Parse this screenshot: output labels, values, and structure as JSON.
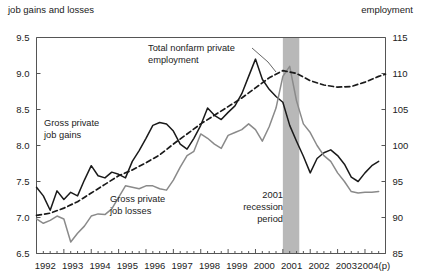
{
  "header": {
    "left_title": "job gains and losses",
    "right_title": "employment"
  },
  "annotations": {
    "nonfarm_line1": "Total nonfarm private",
    "nonfarm_line2": "employment",
    "gains_line1": "Gross private",
    "gains_line2": "job gains",
    "losses_line1": "Gross private",
    "losses_line2": "job losses",
    "recession_line1": "2001",
    "recession_line2": "recession",
    "recession_line3": "period"
  },
  "colors": {
    "gains": "#1a1a1a",
    "losses": "#8a8a8a",
    "employment": "#1a1a1a",
    "recession_band": "#b8b8b8",
    "axis": "#555555"
  },
  "chart_data": {
    "type": "line",
    "title": "",
    "xlabel": "",
    "ylabel": "job gains and losses",
    "y2label": "employment",
    "grid": false,
    "legend": "annotations",
    "ylim": [
      6.5,
      9.5
    ],
    "ytick_labels": [
      "9.5",
      "9.0",
      "8.5",
      "8.0",
      "7.5",
      "7.0",
      "6.5"
    ],
    "yticks": [
      9.5,
      9.0,
      8.5,
      8.0,
      7.5,
      7.0,
      6.5
    ],
    "y2lim": [
      85,
      115
    ],
    "y2ticks": [
      115,
      110,
      105,
      100,
      95,
      90,
      85
    ],
    "y2tick_labels": [
      "115",
      "110",
      "105",
      "100",
      "95",
      "90",
      "85"
    ],
    "xtick_labels": [
      "1992",
      "1993",
      "1994",
      "1995",
      "1996",
      "1997",
      "1998",
      "1999",
      "2000",
      "2001",
      "2002",
      "2003",
      "2004(p)"
    ],
    "x_start_year": 1992,
    "x_end_year": 2004.75,
    "recession_band": {
      "start": 2001.0,
      "end": 2001.6,
      "label": "2001 recession period"
    },
    "series": [
      {
        "name": "Gross private job gains",
        "axis": "left",
        "style": "solid",
        "color": "#1a1a1a",
        "x": [
          1992.0,
          1992.25,
          1992.5,
          1992.75,
          1993.0,
          1993.25,
          1993.5,
          1993.75,
          1994.0,
          1994.25,
          1994.5,
          1994.75,
          1995.0,
          1995.25,
          1995.5,
          1995.75,
          1996.0,
          1996.25,
          1996.5,
          1996.75,
          1997.0,
          1997.25,
          1997.5,
          1997.75,
          1998.0,
          1998.25,
          1998.5,
          1998.75,
          1999.0,
          1999.25,
          1999.5,
          1999.75,
          2000.0,
          2000.25,
          2000.5,
          2000.75,
          2001.0,
          2001.25,
          2001.5,
          2001.75,
          2002.0,
          2002.25,
          2002.5,
          2002.75,
          2003.0,
          2003.25,
          2003.5,
          2003.75,
          2004.0,
          2004.25,
          2004.5
        ],
        "values": [
          7.42,
          7.3,
          7.1,
          7.37,
          7.25,
          7.35,
          7.3,
          7.52,
          7.72,
          7.58,
          7.55,
          7.63,
          7.6,
          7.55,
          7.78,
          7.93,
          8.1,
          8.28,
          8.32,
          8.3,
          8.2,
          8.02,
          7.95,
          8.1,
          8.28,
          8.52,
          8.42,
          8.36,
          8.46,
          8.55,
          8.72,
          8.96,
          9.2,
          8.92,
          8.78,
          8.68,
          8.6,
          8.28,
          8.06,
          7.85,
          7.62,
          7.82,
          7.9,
          7.94,
          7.86,
          7.74,
          7.56,
          7.5,
          7.62,
          7.72,
          7.78
        ]
      },
      {
        "name": "Gross private job losses",
        "axis": "left",
        "style": "solid",
        "color": "#8a8a8a",
        "x": [
          1992.0,
          1992.25,
          1992.5,
          1992.75,
          1993.0,
          1993.25,
          1993.5,
          1993.75,
          1994.0,
          1994.25,
          1994.5,
          1994.75,
          1995.0,
          1995.25,
          1995.5,
          1995.75,
          1996.0,
          1996.25,
          1996.5,
          1996.75,
          1997.0,
          1997.25,
          1997.5,
          1997.75,
          1998.0,
          1998.25,
          1998.5,
          1998.75,
          1999.0,
          1999.25,
          1999.5,
          1999.75,
          2000.0,
          2000.25,
          2000.5,
          2000.75,
          2001.0,
          2001.25,
          2001.5,
          2001.75,
          2002.0,
          2002.25,
          2002.5,
          2002.75,
          2003.0,
          2003.25,
          2003.5,
          2003.75,
          2004.0,
          2004.25,
          2004.5
        ],
        "values": [
          6.98,
          6.92,
          6.96,
          7.02,
          6.98,
          6.66,
          6.78,
          6.88,
          7.02,
          7.05,
          7.04,
          7.12,
          7.28,
          7.44,
          7.42,
          7.4,
          7.44,
          7.44,
          7.4,
          7.38,
          7.52,
          7.7,
          7.86,
          7.92,
          8.16,
          8.1,
          8.02,
          7.96,
          8.14,
          8.18,
          8.22,
          8.3,
          8.22,
          8.06,
          8.26,
          8.52,
          8.96,
          9.1,
          8.62,
          8.3,
          8.18,
          8.0,
          7.86,
          7.78,
          7.62,
          7.5,
          7.36,
          7.34,
          7.35,
          7.35,
          7.36
        ]
      },
      {
        "name": "Total nonfarm private employment",
        "axis": "right",
        "style": "dashed",
        "color": "#1a1a1a",
        "x": [
          1992.0,
          1992.5,
          1993.0,
          1993.5,
          1994.0,
          1994.5,
          1995.0,
          1995.5,
          1996.0,
          1996.5,
          1997.0,
          1997.5,
          1998.0,
          1998.5,
          1999.0,
          1999.5,
          2000.0,
          2000.5,
          2001.0,
          2001.5,
          2002.0,
          2002.5,
          2003.0,
          2003.5,
          2004.0,
          2004.5,
          2004.75
        ],
        "values": [
          90.3,
          90.6,
          91.3,
          92.2,
          93.4,
          94.6,
          95.8,
          96.6,
          97.6,
          98.7,
          100.2,
          101.6,
          103.0,
          104.2,
          105.4,
          106.6,
          108.0,
          109.4,
          110.4,
          110.0,
          109.0,
          108.4,
          108.1,
          108.2,
          108.8,
          109.6,
          109.9
        ]
      }
    ]
  }
}
